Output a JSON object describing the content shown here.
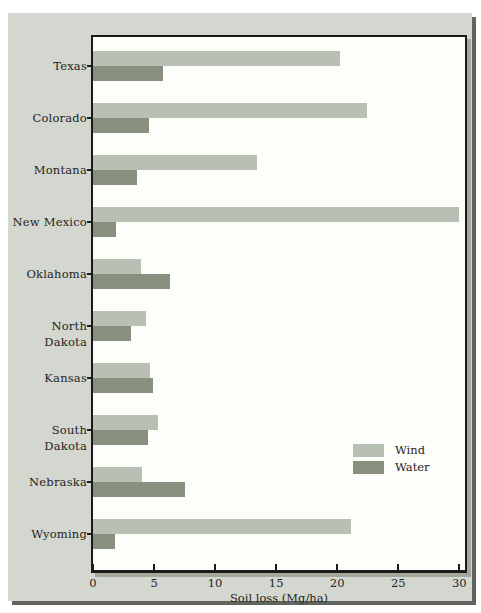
{
  "figure": {
    "type": "textbook-bar-chart-figure",
    "colors": {
      "page_background": "#ffffff",
      "panel_background": "#d3d7cf",
      "panel_shadow": "#5f645e",
      "plot_background": "#fdfdfa",
      "plot_border": "#1a1a18",
      "plot_shadow": "#a3a89c",
      "text": "#262424"
    }
  },
  "chart_data": {
    "type": "bar",
    "orientation": "horizontal",
    "title": "",
    "xlabel": "Soil loss (Mg/ha)",
    "ylabel": "",
    "categories": [
      "Texas",
      "Colorado",
      "Montana",
      "New Mexico",
      "Oklahoma",
      "North Dakota",
      "Kansas",
      "South Dakota",
      "Nebraska",
      "Wyoming"
    ],
    "series": [
      {
        "name": "Wind",
        "color": "#b8bfb3",
        "values": [
          20.2,
          22.4,
          13.4,
          30.0,
          3.9,
          4.3,
          4.7,
          5.3,
          4.0,
          21.1
        ]
      },
      {
        "name": "Water",
        "color": "#87907f",
        "values": [
          5.7,
          4.6,
          3.6,
          1.9,
          6.3,
          3.1,
          4.9,
          4.5,
          7.5,
          1.8
        ]
      }
    ],
    "x_ticks": [
      0,
      5,
      10,
      15,
      20,
      25,
      30
    ],
    "xlim": [
      0,
      30.5
    ],
    "grid": false,
    "legend_position": "inside-right-middle",
    "legend_entries": [
      "Wind",
      "Water"
    ]
  }
}
